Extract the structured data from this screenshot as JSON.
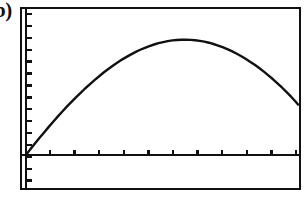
{
  "figure": {
    "panel_label": "b)",
    "background_color": "#ffffff",
    "ink_color": "#111111"
  },
  "frame": {
    "left": 21,
    "top": 8,
    "right": 300,
    "bottom": 189,
    "stroke_width": 2.6
  },
  "axes": {
    "y_axis_x": 26,
    "x_axis_y": 155,
    "axis_stroke_width": 2.4,
    "x_ticks": {
      "count": 11,
      "first_x": 50,
      "spacing": 24.6,
      "length": 5,
      "direction": "up",
      "stroke_width": 2.4
    },
    "y_ticks": {
      "count": 16,
      "first_y": 14,
      "spacing": 11.9,
      "length": 6,
      "direction": "right",
      "stroke_width": 2.4
    }
  },
  "chart_data": {
    "type": "line",
    "title": "",
    "subtitle": "",
    "xlabel": "",
    "ylabel": "",
    "xlim": [
      0,
      11
    ],
    "ylim": [
      0,
      10.4
    ],
    "grid": false,
    "legend": null,
    "tick_labels_shown": false,
    "series": [
      {
        "name": "curve",
        "color": "#111111",
        "stroke_width": 2.4,
        "x": [
          0.0,
          0.18,
          0.37,
          0.55,
          0.74,
          0.92,
          1.11,
          1.29,
          1.48,
          1.66,
          1.85,
          2.03,
          2.22,
          2.4,
          2.59,
          2.77,
          2.96,
          3.14,
          3.33,
          3.51,
          3.7,
          3.88,
          4.07,
          4.25,
          4.44,
          4.62,
          4.81,
          4.99,
          5.18,
          5.36,
          5.55,
          5.73,
          5.92,
          6.1,
          6.29,
          6.47,
          6.66,
          6.84,
          7.03,
          7.21,
          7.4,
          7.58,
          7.77,
          7.95,
          8.14,
          8.32,
          8.51,
          8.69,
          8.88,
          9.06,
          9.25,
          9.43,
          9.62,
          9.8,
          9.99,
          10.17,
          10.36,
          10.54,
          10.73,
          10.91,
          11.0
        ],
        "y": [
          0.0,
          0.46,
          0.91,
          1.35,
          1.78,
          2.2,
          2.62,
          3.02,
          3.42,
          3.8,
          4.17,
          4.53,
          4.88,
          5.22,
          5.55,
          5.86,
          6.16,
          6.45,
          6.72,
          6.98,
          7.23,
          7.46,
          7.67,
          7.87,
          8.06,
          8.23,
          8.38,
          8.52,
          8.64,
          8.75,
          8.83,
          8.9,
          8.96,
          8.99,
          9.01,
          9.01,
          9.0,
          8.97,
          8.92,
          8.86,
          8.78,
          8.68,
          8.56,
          8.43,
          8.28,
          8.12,
          7.94,
          7.74,
          7.53,
          7.3,
          7.06,
          6.8,
          6.52,
          6.23,
          5.92,
          5.6,
          5.26,
          4.91,
          4.54,
          4.16,
          3.95
        ]
      }
    ]
  }
}
